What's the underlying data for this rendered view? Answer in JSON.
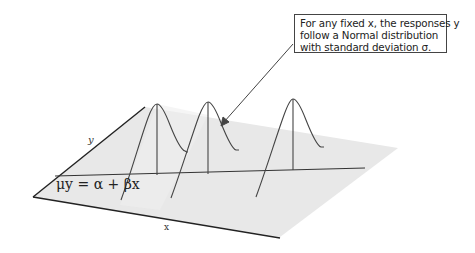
{
  "callout": {
    "lines": [
      "For any fixed x, the responses y",
      "follow a Normal distribution",
      "with standard deviation σ."
    ]
  },
  "labels": {
    "y_axis": "y",
    "x_axis": "x",
    "regression_equation": "μy = α + βx"
  },
  "colors": {
    "plane": "#e6e6e6",
    "lines": "#333333",
    "background": "#ffffff"
  },
  "distributions": [
    {
      "name": "normal-curve-1",
      "peak_x": 157
    },
    {
      "name": "normal-curve-2",
      "peak_x": 208
    },
    {
      "name": "normal-curve-3",
      "peak_x": 293
    }
  ]
}
